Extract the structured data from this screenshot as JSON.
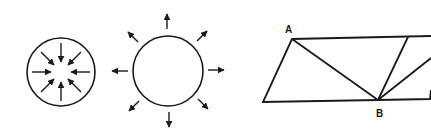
{
  "figure": {
    "stroke_color": "#1a1a1a",
    "background": "#ffffff",
    "panels": [
      {
        "id": "implosion",
        "description": "circle with 8 arrows pointing inward",
        "arrow_count": 8,
        "direction": "inward"
      },
      {
        "id": "explosion",
        "description": "circle with 8 arrows pointing outward",
        "arrow_count": 8,
        "direction": "outward"
      },
      {
        "id": "parallelogram",
        "description": "parallelogram divided by lines radiating from point B",
        "labels": {
          "a": "A",
          "b": "B"
        }
      }
    ]
  }
}
